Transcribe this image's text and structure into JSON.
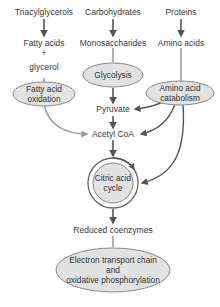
{
  "diagram": {
    "type": "metabolic-pathway-flowchart",
    "colors": {
      "arrow": "#555555",
      "fatty_acid_arrow": "#9a9a9a",
      "node_fill": "#e2e2e2",
      "node_stroke": "#8a8a8a",
      "text": "#333333"
    },
    "sources": {
      "triacylglycerols": "Triacylglycerols",
      "carbohydrates": "Carbohydrates",
      "proteins": "Proteins"
    },
    "intermediates": {
      "fatty_acids_line1": "Fatty acids",
      "fatty_acids_plus": "+",
      "fatty_acids_line2": "glycerol",
      "monosaccharides": "Monosaccharides",
      "amino_acids": "Amino acids",
      "pyruvate": "Pyruvate",
      "acetyl_coa": "Acetyl CoA",
      "reduced_coenzymes": "Reduced coenzymes"
    },
    "processes": {
      "fatty_acid_oxidation_line1": "Fatty acid",
      "fatty_acid_oxidation_line2": "oxidation",
      "glycolysis": "Glycolysis",
      "amino_acid_catabolism_line1": "Amino acid",
      "amino_acid_catabolism_line2": "catabolism",
      "citric_acid_cycle_line1": "Citric acid",
      "citric_acid_cycle_line2": "cycle",
      "etc_line1": "Electron transport chain",
      "etc_line2": "and",
      "etc_line3": "oxidative phosphorylation"
    }
  }
}
